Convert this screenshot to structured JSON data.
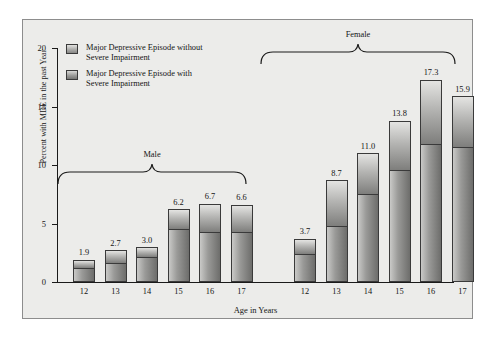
{
  "chart_data": {
    "type": "bar",
    "title": "",
    "xlabel": "Age in Years",
    "ylabel": "Percent with MDE in the past Year",
    "ylim": [
      0,
      20
    ],
    "yticks": [
      "0",
      "5",
      "10",
      "15",
      "20"
    ],
    "grid": false,
    "stacked": true,
    "legend_position": "top-left",
    "categories": [
      "12",
      "13",
      "14",
      "15",
      "16",
      "17",
      "12",
      "13",
      "14",
      "15",
      "16",
      "17"
    ],
    "groups": [
      {
        "name": "Male",
        "categories": [
          "12",
          "13",
          "14",
          "15",
          "16",
          "17"
        ]
      },
      {
        "name": "Female",
        "categories": [
          "12",
          "13",
          "14",
          "15",
          "16",
          "17"
        ]
      }
    ],
    "series": [
      {
        "name": "Major Depressive Episode with Severe Impairment",
        "values": [
          1.2,
          1.6,
          2.1,
          4.5,
          4.3,
          4.3,
          2.4,
          4.8,
          7.5,
          9.6,
          11.8,
          11.5
        ]
      },
      {
        "name": "Major Depressive Episode without Severe Impairment",
        "values": [
          0.7,
          1.1,
          0.9,
          1.7,
          2.4,
          2.3,
          1.3,
          3.9,
          3.5,
          4.2,
          5.5,
          4.4
        ]
      }
    ],
    "bars": [
      {
        "group": "Male",
        "age": "12",
        "total": "1.9",
        "total_value": 1.9,
        "lower": 1.2,
        "upper": 0.7
      },
      {
        "group": "Male",
        "age": "13",
        "total": "2.7",
        "total_value": 2.7,
        "lower": 1.6,
        "upper": 1.1
      },
      {
        "group": "Male",
        "age": "14",
        "total": "3.0",
        "total_value": 3.0,
        "lower": 2.1,
        "upper": 0.9
      },
      {
        "group": "Male",
        "age": "15",
        "total": "6.2",
        "total_value": 6.2,
        "lower": 4.5,
        "upper": 1.7
      },
      {
        "group": "Male",
        "age": "16",
        "total": "6.7",
        "total_value": 6.7,
        "lower": 4.3,
        "upper": 2.4
      },
      {
        "group": "Male",
        "age": "17",
        "total": "6.6",
        "total_value": 6.6,
        "lower": 4.3,
        "upper": 2.3
      },
      {
        "group": "Female",
        "age": "12",
        "total": "3.7",
        "total_value": 3.7,
        "lower": 2.4,
        "upper": 1.3
      },
      {
        "group": "Female",
        "age": "13",
        "total": "8.7",
        "total_value": 8.7,
        "lower": 4.8,
        "upper": 3.9
      },
      {
        "group": "Female",
        "age": "14",
        "total": "11.0",
        "total_value": 11.0,
        "lower": 7.5,
        "upper": 3.5
      },
      {
        "group": "Female",
        "age": "15",
        "total": "13.8",
        "total_value": 13.8,
        "lower": 9.6,
        "upper": 4.2
      },
      {
        "group": "Female",
        "age": "16",
        "total": "17.3",
        "total_value": 17.3,
        "lower": 11.8,
        "upper": 5.5
      },
      {
        "group": "Female",
        "age": "17",
        "total": "15.9",
        "total_value": 15.9,
        "lower": 11.5,
        "upper": 4.4
      }
    ]
  },
  "axes": {
    "y_label": "Percent with MDE in the past Year",
    "x_label": "Age in Years",
    "y_ticks": [
      "20",
      "15",
      "10",
      "5",
      "0"
    ]
  },
  "legend": {
    "items": [
      {
        "key": "light",
        "line1": "Major Depressive Episode without",
        "line2": "Severe Impairment"
      },
      {
        "key": "dark",
        "line1": "Major Depressive Episode with",
        "line2": "Severe Impairment"
      }
    ]
  },
  "brackets": {
    "male_label": "Male",
    "female_label": "Female"
  },
  "colors": {
    "panel_background": "#ececea",
    "panel_border": "#8d8d8d",
    "axis": "#1a1a1a",
    "text": "#141414",
    "bar_light": "#b4b4b2",
    "bar_dark": "#7e7e7c"
  }
}
